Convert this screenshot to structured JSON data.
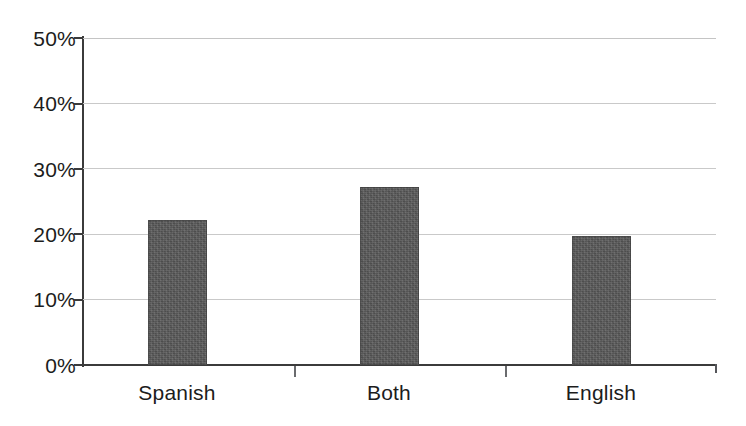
{
  "chart_data": {
    "type": "bar",
    "title": "",
    "subtitle": "",
    "xlabel": "",
    "ylabel": "",
    "categories": [
      "Spanish",
      "Both",
      "English"
    ],
    "values": [
      22.2,
      27.2,
      19.7
    ],
    "value_labels": [
      "22.2%",
      "27.2%",
      "19.7%"
    ],
    "ylim": [
      0,
      50
    ],
    "ytick_labels": [
      "0%",
      "10%",
      "20%",
      "30%",
      "40%",
      "50%"
    ],
    "ytick_values": [
      0,
      10,
      20,
      30,
      40,
      50
    ],
    "grid": true,
    "grid_axis": "y",
    "legend": false,
    "legend_position": "none",
    "series": [
      {
        "name": "Language",
        "values": [
          22.2,
          27.2,
          19.7
        ],
        "color": "#585858"
      }
    ],
    "colors": {
      "bar_fill": "#585858",
      "gridline": "#c9c9c9",
      "axis": "#3b3b3b",
      "text": "#1c1c1c",
      "background": "#ffffff"
    }
  },
  "axis": {
    "y_ticks": [
      {
        "label": "50%",
        "top": 28
      },
      {
        "label": "40%",
        "top": 93
      },
      {
        "label": "30%",
        "top": 159
      },
      {
        "label": "20%",
        "top": 224
      },
      {
        "label": "10%",
        "top": 289
      },
      {
        "label": "0%",
        "top": 355
      }
    ]
  },
  "categories": [
    {
      "label": "Spanish",
      "left": 106,
      "width": 142
    },
    {
      "label": "Both",
      "left": 318,
      "width": 142
    },
    {
      "label": "English",
      "left": 530,
      "width": 142
    }
  ]
}
